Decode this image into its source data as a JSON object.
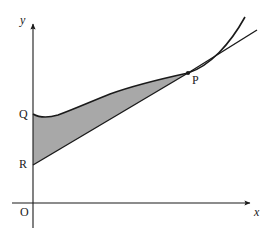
{
  "figure": {
    "background_color": "#ffffff",
    "stroke_color": "#1a1a1a",
    "shade_color": "#a8a8a8",
    "axes": {
      "x_axis_label": "x",
      "y_axis_label": "y",
      "origin_label": "O",
      "x_axis_y_pixel": 203,
      "y_axis_x_pixel": 33,
      "x_axis_start": 12,
      "x_axis_end": 252,
      "y_axis_top": 22,
      "y_axis_bottom": 228,
      "arrowheads": [
        "x-axis-right",
        "y-axis-top"
      ]
    },
    "points": [
      {
        "label": "Q",
        "x": 33,
        "y": 114,
        "description": "curve y-intercept"
      },
      {
        "label": "R",
        "x": 33,
        "y": 165,
        "description": "line y-intercept"
      },
      {
        "label": "P",
        "x": 188,
        "y": 73,
        "description": "tangency point, marked with dot"
      }
    ],
    "curve": {
      "name": "curve",
      "description": "convex increasing curve with shallow minimum near x=50, passing through Q and P",
      "path": "M 33 114 C 40 118, 48 118, 58 115 C 72 110, 90 102, 110 94 C 135 85, 165 78, 188 73 C 210 66, 230 44, 245 17"
    },
    "tangent": {
      "name": "tangent-line",
      "description": "tangent to the curve at P, extended beyond P to the upper right",
      "path": "M 188 73 L 257 30"
    },
    "chord": {
      "name": "chord-line",
      "description": "straight line from R on the y-axis through to P",
      "path": "M 33 165 L 188 73"
    },
    "shaded_region": {
      "name": "shaded-region",
      "description": "region bounded above by the curve from Q to P and below by the line R to P, closed along the y-axis from Q down to R",
      "path": "M 33 114 C 40 118, 48 118, 58 115 C 72 110, 90 102, 110 94 C 135 85, 165 78, 188 73 L 33 165 Z"
    }
  }
}
